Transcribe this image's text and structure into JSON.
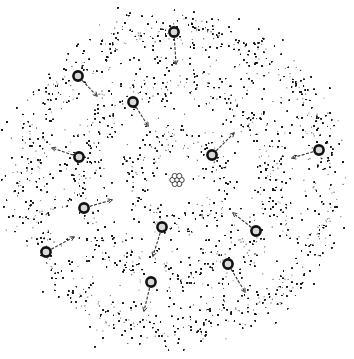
{
  "diagram": {
    "title": "Atom with electron shells (stippled orbital density illustration)",
    "background": "#ffffff",
    "ink": "#1a1a1a",
    "center": [
      177,
      180
    ],
    "nucleus": {
      "label": "nucleus",
      "particles": 7,
      "radius": 9
    },
    "shells": [
      {
        "name": "inner-shell",
        "radius": 42,
        "width": 22,
        "darkness": 0.95
      },
      {
        "name": "middle-shell",
        "radius": 97,
        "width": 28,
        "darkness": 0.9
      },
      {
        "name": "outer-shell",
        "radius": 148,
        "width": 26,
        "darkness": 0.95
      }
    ],
    "electrons": [
      {
        "x": 174,
        "y": 32,
        "ax": 176,
        "ay": 64
      },
      {
        "x": 78,
        "y": 76,
        "ax": 97,
        "ay": 96
      },
      {
        "x": 133,
        "y": 102,
        "ax": 148,
        "ay": 126
      },
      {
        "x": 212,
        "y": 155,
        "ax": 234,
        "ay": 133
      },
      {
        "x": 319,
        "y": 150,
        "ax": 292,
        "ay": 158
      },
      {
        "x": 79,
        "y": 157,
        "ax": 52,
        "ay": 148
      },
      {
        "x": 84,
        "y": 208,
        "ax": 112,
        "ay": 200
      },
      {
        "x": 46,
        "y": 252,
        "ax": 74,
        "ay": 237
      },
      {
        "x": 162,
        "y": 227,
        "ax": 153,
        "ay": 256
      },
      {
        "x": 256,
        "y": 231,
        "ax": 233,
        "ay": 213
      },
      {
        "x": 228,
        "y": 264,
        "ax": 245,
        "ay": 292
      },
      {
        "x": 151,
        "y": 282,
        "ax": 144,
        "ay": 311
      }
    ],
    "faint_arrow": {
      "x1": 193,
      "y1": 232,
      "x2": 192,
      "y2": 223
    }
  }
}
